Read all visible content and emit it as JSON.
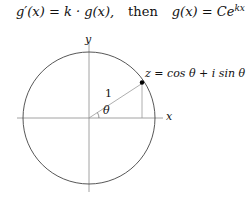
{
  "formula": {
    "lhs": "g′(x) = k · g(x),",
    "connector": "then",
    "rhs": "g(x) = Ce",
    "rhs_exponent": "kx"
  },
  "diagram": {
    "axis_labels": {
      "x": "x",
      "y": "y"
    },
    "radius_label": "1",
    "angle_label": "θ",
    "point_label": "z = cos θ + i sin θ",
    "angle_degrees": 33,
    "colors": {
      "circle": "#444444",
      "axes": "#888888",
      "radius": "#999999",
      "point": "#000000"
    }
  }
}
